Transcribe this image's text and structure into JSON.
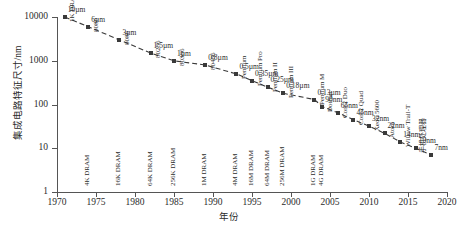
{
  "chart_data": {
    "type": "line",
    "title": "",
    "xlabel": "年份",
    "ylabel": "集成电路特征尺寸/nm",
    "xlim": [
      1970,
      2020
    ],
    "ylim": [
      1,
      10000
    ],
    "yscale": "log",
    "grid": false,
    "legend": "none",
    "xticks": [
      "1970",
      "1975",
      "1980",
      "1985",
      "1990",
      "1995",
      "2000",
      "2005",
      "2010",
      "2015",
      "2020"
    ],
    "yticks": [
      "1",
      "10",
      "100",
      "1000",
      "10000"
    ],
    "x": [
      1971,
      1974,
      1978,
      1982,
      1985,
      1989,
      1993,
      1995,
      1997,
      1999,
      2003,
      2004,
      2006,
      2008,
      2010,
      2012,
      2014,
      2016,
      2018
    ],
    "values": [
      10000,
      6000,
      3000,
      1500,
      1000,
      800,
      500,
      350,
      250,
      180,
      130,
      90,
      65,
      45,
      32,
      22,
      14,
      10,
      7
    ],
    "point_labels": [
      "10µm",
      "6µm",
      "3µm",
      "1.5µm",
      "1µm",
      "0.8µm",
      "0.5µm",
      "0.35µm",
      "0.25µm",
      "0.18µm",
      "0.13µm",
      "90nm",
      "65nm",
      "45nm",
      "32nm",
      "22nm",
      "14nm",
      "10nm",
      "7nm"
    ],
    "processor_labels": [
      "1K DRAM(动态随机存储器)4004",
      "8080",
      "8086",
      "80286",
      "80386",
      "80486",
      "Pentium",
      "Pentium Pro",
      "Pentium II",
      "Pentium III",
      "Pentium M",
      "Dothan",
      "Core2 Duo",
      "Core2 Quad",
      "Xeon 5600",
      "Atom",
      "Willow Trail-T",
      "手机处理器",
      ""
    ],
    "memory_labels": [
      "",
      "4K DRAM",
      "16K DRAM",
      "64K DRAM",
      "256K DRAM",
      "1M DRAM",
      "4M DRAM",
      "16M DRAM",
      "64M DRAM",
      "256M DRAM",
      "1G DRAM",
      "4G DRAM",
      "",
      "",
      "",
      "",
      "",
      "",
      ""
    ],
    "series_color": "#3a3a3a",
    "line_style": "dashed"
  },
  "caption": ""
}
